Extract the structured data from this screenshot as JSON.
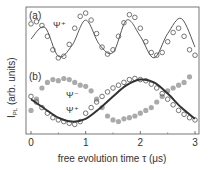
{
  "chart_data": {
    "type": "scatter",
    "title": "",
    "xlabel": "free evolution time τ (μs)",
    "ylabel": "I_PL (arb. units)",
    "xlim": [
      -0.1,
      3.1
    ],
    "xticks": [
      0,
      1,
      2,
      3
    ],
    "xtick_labels": [
      "0",
      "1",
      "2",
      "3"
    ],
    "grid": false,
    "panels": [
      {
        "label": "(a)",
        "annotations": [
          "Ψ⁺"
        ],
        "series": [
          {
            "name": "Ψ+ data",
            "style": "open-circles",
            "x": [
              0.0,
              0.1,
              0.2,
              0.3,
              0.4,
              0.5,
              0.6,
              0.7,
              0.8,
              0.9,
              1.0,
              1.1,
              1.2,
              1.3,
              1.4,
              1.5,
              1.6,
              1.7,
              1.8,
              1.9,
              2.0,
              2.1,
              2.2,
              2.3,
              2.4,
              2.5,
              2.6,
              2.7,
              2.8,
              2.9,
              3.0
            ],
            "y": [
              0.78,
              0.82,
              0.75,
              0.55,
              0.3,
              0.15,
              0.18,
              0.4,
              0.7,
              0.92,
              0.98,
              0.85,
              0.6,
              0.35,
              0.22,
              0.3,
              0.55,
              0.8,
              0.95,
              0.9,
              0.7,
              0.45,
              0.25,
              0.2,
              0.25,
              0.45,
              0.62,
              0.7,
              0.55,
              0.3,
              0.2
            ]
          },
          {
            "name": "Ψ+ fit",
            "style": "line",
            "x": [
              0.0,
              0.25,
              0.5,
              0.75,
              1.0,
              1.25,
              1.5,
              1.75,
              2.0,
              2.25,
              2.5,
              2.75,
              3.0
            ],
            "y": [
              0.5,
              0.72,
              0.18,
              0.38,
              0.85,
              0.4,
              0.25,
              0.85,
              0.55,
              0.15,
              0.6,
              0.88,
              0.35
            ]
          }
        ]
      },
      {
        "label": "(b)",
        "annotations": [
          "Ψ⁻",
          "Ψ⁺"
        ],
        "series": [
          {
            "name": "Ψ- data",
            "style": "filled-gray-circles",
            "x": [
              0.0,
              0.1,
              0.2,
              0.3,
              0.4,
              0.5,
              0.6,
              0.7,
              0.8,
              0.9,
              1.0,
              1.1,
              1.2,
              1.3,
              1.4,
              1.5,
              1.6,
              1.7,
              1.8,
              1.9,
              2.0,
              2.1,
              2.2,
              2.3,
              2.4,
              2.5,
              2.6,
              2.7,
              2.8,
              2.9
            ],
            "y": [
              0.35,
              0.55,
              0.75,
              0.85,
              0.9,
              0.88,
              0.92,
              0.9,
              0.85,
              0.8,
              0.78,
              0.7,
              0.55,
              0.4,
              0.25,
              0.18,
              0.15,
              0.2,
              0.22,
              0.25,
              0.3,
              0.35,
              0.4,
              0.5,
              0.6,
              0.7,
              0.75,
              0.8,
              0.85,
              0.95
            ]
          },
          {
            "name": "Ψ+ data",
            "style": "open-circles",
            "x": [
              0.0,
              0.1,
              0.2,
              0.3,
              0.4,
              0.5,
              0.6,
              0.7,
              0.8,
              0.9,
              1.0,
              1.1,
              1.2,
              1.3,
              1.4,
              1.5,
              1.6,
              1.7,
              1.8,
              1.9,
              2.0,
              2.1,
              2.2,
              2.3,
              2.4,
              2.5,
              2.6,
              2.7,
              2.8,
              2.9,
              3.0
            ],
            "y": [
              0.6,
              0.5,
              0.4,
              0.3,
              0.22,
              0.18,
              0.15,
              0.12,
              0.1,
              0.15,
              0.3,
              0.4,
              0.5,
              0.6,
              0.68,
              0.75,
              0.8,
              0.85,
              0.9,
              0.92,
              0.9,
              0.88,
              0.82,
              0.75,
              0.65,
              0.55,
              0.45,
              0.35,
              0.28,
              0.22,
              0.18
            ]
          },
          {
            "name": "Ψ+ fit",
            "style": "thick-dark-line",
            "x": [
              0.0,
              0.25,
              0.5,
              0.75,
              1.0,
              1.25,
              1.5,
              1.75,
              2.0,
              2.25,
              2.5,
              2.75,
              3.0
            ],
            "y": [
              0.55,
              0.38,
              0.22,
              0.15,
              0.2,
              0.38,
              0.6,
              0.8,
              0.9,
              0.85,
              0.65,
              0.4,
              0.2
            ]
          }
        ]
      }
    ]
  }
}
